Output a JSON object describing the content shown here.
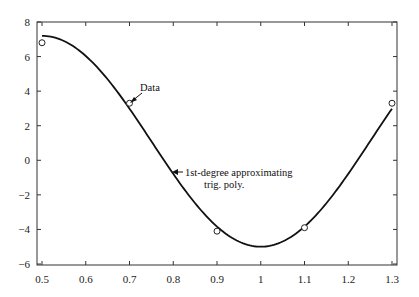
{
  "chart_data": {
    "type": "line",
    "title": "",
    "xlabel": "",
    "ylabel": "",
    "xlim": [
      0.5,
      1.3
    ],
    "ylim": [
      -6,
      8
    ],
    "grid": false,
    "legend": null,
    "x_ticks": [
      0.5,
      0.6,
      0.7,
      0.8,
      0.9,
      1,
      1.1,
      1.2,
      1.3
    ],
    "x_tick_labels": [
      "0.5",
      "0.6",
      "0.7",
      "0.8",
      "0.9",
      "1",
      "1.1",
      "1.2",
      "1.3"
    ],
    "y_ticks": [
      8,
      6,
      4,
      2,
      0,
      -2,
      -4,
      -6
    ],
    "y_tick_labels": [
      "8",
      "6",
      "4",
      "2",
      "0",
      "−2",
      "−4",
      "−6"
    ],
    "series": [
      {
        "name": "Data",
        "kind": "scatter",
        "marker": "open-circle",
        "x": [
          0.5,
          0.7,
          0.9,
          1.1,
          1.3
        ],
        "y": [
          6.8,
          3.3,
          -4.1,
          -3.9,
          3.3
        ]
      },
      {
        "name": "1st-degree approximating trig. poly.",
        "kind": "line",
        "color": "#111111",
        "model": {
          "c": 1.1,
          "amplitude": 6.1,
          "period": 1.0,
          "min_at": 1.0
        },
        "x": [
          0.5,
          0.6,
          0.7,
          0.8,
          0.9,
          1.0,
          1.1,
          1.2,
          1.3
        ],
        "y": [
          7.2,
          6.04,
          2.98,
          -0.79,
          -3.83,
          -5.0,
          -3.83,
          -0.79,
          2.98
        ]
      }
    ],
    "annotations": [
      {
        "text": "Data",
        "points_to": [
          0.7,
          3.3
        ]
      },
      {
        "text_line1": "1st-degree approximating",
        "text_line2": "trig. poly.",
        "points_to": [
          0.8,
          -0.6
        ]
      }
    ]
  },
  "annotations": {
    "data_label": "Data",
    "curve_label_line1": "1st-degree approximating",
    "curve_label_line2": "trig. poly."
  }
}
